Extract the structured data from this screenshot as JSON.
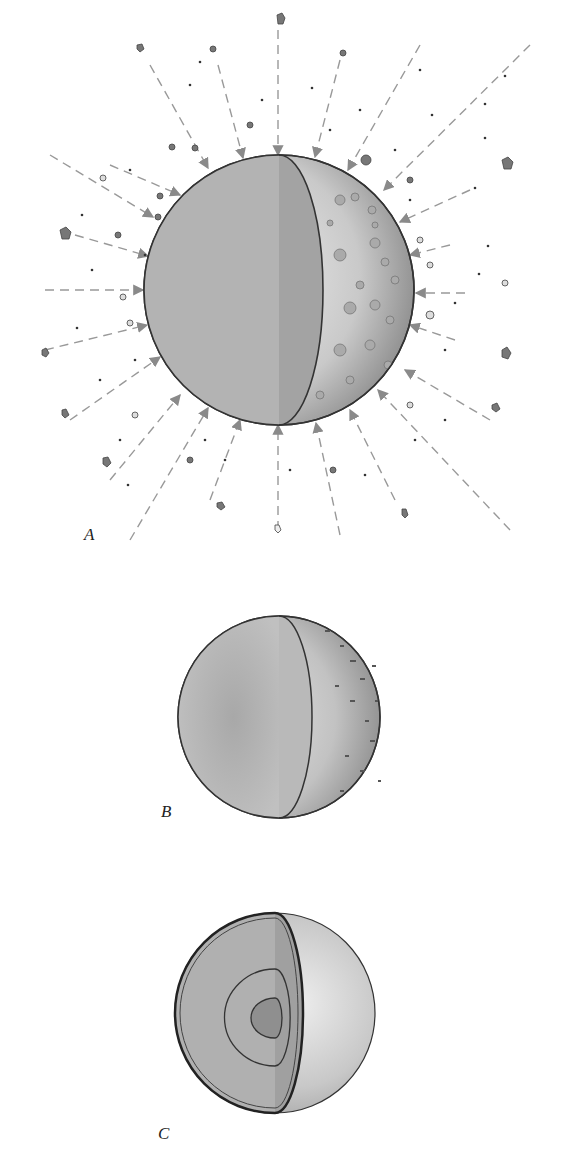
{
  "figure": {
    "panels": [
      {
        "id": "A",
        "label": "A",
        "description": "Accretion: planetesimals bombarding a growing protoplanet (cutaway sphere with cratered surface)"
      },
      {
        "id": "B",
        "label": "B",
        "description": "Heated, partially molten protoplanet (cutaway sphere)"
      },
      {
        "id": "C",
        "label": "C",
        "description": "Differentiated planet with core, mantle and crust layers (cutaway sphere)"
      }
    ]
  },
  "colors": {
    "background": "#ffffff",
    "sphere_fill": "#b8b8b8",
    "cut_face": "#a9a9a9",
    "outline": "#333333",
    "arrow": "#8a8a8a",
    "debris": "#777777"
  }
}
